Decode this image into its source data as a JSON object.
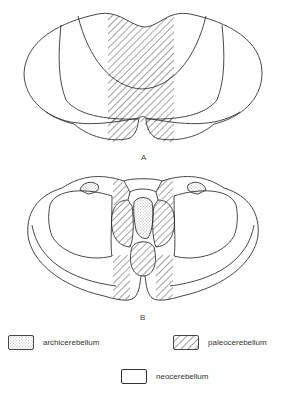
{
  "figure": {
    "panel_a_label": "A",
    "panel_b_label": "B"
  },
  "legend": {
    "items": [
      {
        "label": "archicerebellum",
        "pattern": "stippled"
      },
      {
        "label": "paleocerebellum",
        "pattern": "hatched"
      },
      {
        "label": "neocerebellum",
        "pattern": "blank"
      }
    ]
  },
  "colors": {
    "stroke": "#333333",
    "background": "#ffffff"
  }
}
